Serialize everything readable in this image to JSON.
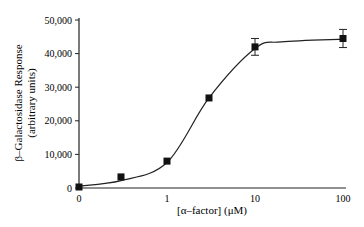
{
  "chart_data": {
    "type": "scatter",
    "title": "",
    "xlabel": "[α–factor] (μM)",
    "ylabel": "β–Galactosidase Response",
    "ylabel_sub": "(arbitrary units)",
    "x_scale": "log (with break at 0)",
    "xticks": [
      "0",
      "1",
      "10",
      "100"
    ],
    "yticks": [
      "0",
      "10,000",
      "20,000",
      "30,000",
      "40,000",
      "50,000"
    ],
    "ylim": [
      0,
      50000
    ],
    "grid": false,
    "legend": null,
    "series": [
      {
        "name": "measured",
        "marker": "filled-square",
        "x": [
          0,
          0.3,
          1,
          3,
          10,
          100
        ],
        "y": [
          300,
          3300,
          8000,
          26800,
          42000,
          44500
        ],
        "error": [
          0,
          0,
          0,
          0,
          2500,
          2700
        ]
      },
      {
        "name": "fit",
        "style": "smooth-line",
        "x": [
          0,
          0.3,
          1,
          3,
          10,
          20,
          100
        ],
        "y": [
          600,
          2200,
          7600,
          26800,
          41500,
          43500,
          44300
        ]
      }
    ]
  }
}
